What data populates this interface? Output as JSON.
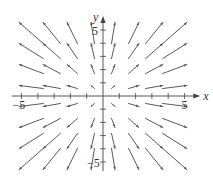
{
  "figure": {
    "type": "vector-field",
    "field": "F(x,y) = <x, y>",
    "axes": {
      "x_label": "x",
      "y_label": "y",
      "x_ticks": [
        -5,
        -4,
        -3,
        -2,
        -1,
        1,
        2,
        3,
        4,
        5
      ],
      "y_ticks": [
        -5,
        -4,
        -3,
        -2,
        -1,
        1,
        2,
        3,
        4,
        5
      ],
      "x_tick_labels": {
        "neg": "−5",
        "pos": "5"
      },
      "y_tick_labels": {
        "neg": "−5",
        "pos": "5"
      },
      "xlim": [
        -5.5,
        5.5
      ],
      "ylim": [
        -5.5,
        5.5
      ]
    },
    "grid_points": [
      -3.5,
      -2.5,
      -1.5,
      -0.5,
      0.5,
      1.5,
      2.5,
      3.5
    ],
    "colors": {
      "axis": "#444444",
      "arrow": "#5a5a5a",
      "label": "#333333"
    }
  },
  "layout": {
    "origin_px": [
      103,
      96
    ],
    "x_unit_px": 16.3,
    "y_unit_px": 13.2,
    "cell_px_x": 20.5,
    "cell_px_y": 18.0,
    "arrow_scale": 0.34
  }
}
